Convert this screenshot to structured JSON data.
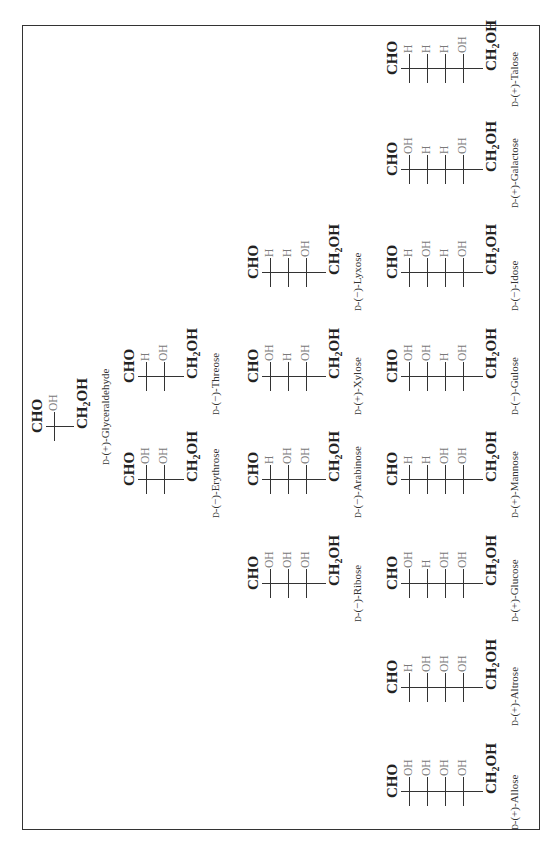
{
  "figure": {
    "top_group": "CHO",
    "bottom_group_main": "CH",
    "bottom_group_sub": "2",
    "bottom_group_tail": "OH",
    "colors": {
      "text": "#222222",
      "substituent": "#7a7a7a",
      "line": "#333333",
      "frame": "#333333"
    },
    "molecules": [
      {
        "id": "glyceraldehyde",
        "prefix": "D",
        "name": "-(+)-Glyceraldehyde",
        "tier": 3,
        "cx": 420,
        "substituents": [
          [
            "H",
            "OH"
          ]
        ]
      },
      {
        "id": "erythrose",
        "prefix": "D",
        "name": "-(−)-Erythrose",
        "tier": 4,
        "cx": 367,
        "substituents": [
          [
            "H",
            "OH"
          ],
          [
            "H",
            "OH"
          ]
        ]
      },
      {
        "id": "threose",
        "prefix": "D",
        "name": "-(−)-Threose",
        "tier": 4,
        "cx": 470,
        "substituents": [
          [
            "HO",
            "H"
          ],
          [
            "H",
            "OH"
          ]
        ]
      },
      {
        "id": "ribose",
        "prefix": "D",
        "name": "-(−)-Ribose",
        "tier": 5,
        "cx": 263,
        "substituents": [
          [
            "H",
            "OH"
          ],
          [
            "H",
            "OH"
          ],
          [
            "H",
            "OH"
          ]
        ]
      },
      {
        "id": "arabinose",
        "prefix": "D",
        "name": "-(−)-Arabinose",
        "tier": 5,
        "cx": 367,
        "substituents": [
          [
            "HO",
            "H"
          ],
          [
            "H",
            "OH"
          ],
          [
            "H",
            "OH"
          ]
        ]
      },
      {
        "id": "xylose",
        "prefix": "D",
        "name": "-(+)-Xylose",
        "tier": 5,
        "cx": 470,
        "substituents": [
          [
            "H",
            "OH"
          ],
          [
            "HO",
            "H"
          ],
          [
            "H",
            "OH"
          ]
        ]
      },
      {
        "id": "lyxose",
        "prefix": "D",
        "name": "-(−)-Lyxose",
        "tier": 5,
        "cx": 574,
        "substituents": [
          [
            "HO",
            "H"
          ],
          [
            "HO",
            "H"
          ],
          [
            "H",
            "OH"
          ]
        ]
      },
      {
        "id": "allose",
        "prefix": "D",
        "name": "-(+)-Allose",
        "tier": 6,
        "cx": 55,
        "substituents": [
          [
            "H",
            "OH"
          ],
          [
            "H",
            "OH"
          ],
          [
            "H",
            "OH"
          ],
          [
            "H",
            "OH"
          ]
        ]
      },
      {
        "id": "altrose",
        "prefix": "D",
        "name": "-(+)-Altrose",
        "tier": 6,
        "cx": 159,
        "substituents": [
          [
            "HO",
            "H"
          ],
          [
            "H",
            "OH"
          ],
          [
            "H",
            "OH"
          ],
          [
            "H",
            "OH"
          ]
        ]
      },
      {
        "id": "glucose",
        "prefix": "D",
        "name": "-(+)-Glucose",
        "tier": 6,
        "cx": 263,
        "substituents": [
          [
            "H",
            "OH"
          ],
          [
            "HO",
            "H"
          ],
          [
            "H",
            "OH"
          ],
          [
            "H",
            "OH"
          ]
        ]
      },
      {
        "id": "mannose",
        "prefix": "D",
        "name": "-(+)-Mannose",
        "tier": 6,
        "cx": 367,
        "substituents": [
          [
            "HO",
            "H"
          ],
          [
            "HO",
            "H"
          ],
          [
            "H",
            "OH"
          ],
          [
            "H",
            "OH"
          ]
        ]
      },
      {
        "id": "gulose",
        "prefix": "D",
        "name": "-(−)-Gulose",
        "tier": 6,
        "cx": 470,
        "substituents": [
          [
            "H",
            "OH"
          ],
          [
            "H",
            "OH"
          ],
          [
            "HO",
            "H"
          ],
          [
            "H",
            "OH"
          ]
        ]
      },
      {
        "id": "idose",
        "prefix": "D",
        "name": "-(−)-Idose",
        "tier": 6,
        "cx": 574,
        "substituents": [
          [
            "HO",
            "H"
          ],
          [
            "H",
            "OH"
          ],
          [
            "HO",
            "H"
          ],
          [
            "H",
            "OH"
          ]
        ]
      },
      {
        "id": "galactose",
        "prefix": "D",
        "name": "-(+)-Galactose",
        "tier": 6,
        "cx": 677,
        "substituents": [
          [
            "H",
            "OH"
          ],
          [
            "HO",
            "H"
          ],
          [
            "HO",
            "H"
          ],
          [
            "H",
            "OH"
          ]
        ]
      },
      {
        "id": "talose",
        "prefix": "D",
        "name": "-(+)-Talose",
        "tier": 6,
        "cx": 778,
        "substituents": [
          [
            "HO",
            "H"
          ],
          [
            "HO",
            "H"
          ],
          [
            "HO",
            "H"
          ],
          [
            "H",
            "OH"
          ]
        ]
      }
    ]
  }
}
